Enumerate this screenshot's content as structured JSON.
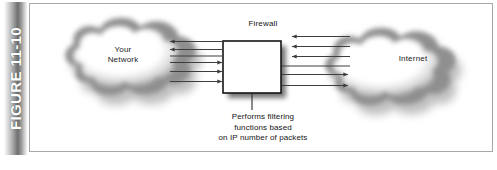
{
  "figure": {
    "tab_label": "FIGURE 11-10",
    "caption_alt": "Firewall between your network and the Internet"
  },
  "diagram": {
    "firewall_title": "Firewall",
    "firewall_caption": "Performs filtering\nfunctions based\non IP number of packets",
    "left_cloud_label": "Your\nNetwork",
    "right_cloud_label": "Internet",
    "arrows": {
      "left_group_inbound_count": 2,
      "left_group_outbound_count": 3,
      "right_group_inbound_count": 3,
      "right_group_outbound_count": 2
    }
  },
  "colors": {
    "tab_dark": "#6e6e6e",
    "tab_light": "#f2f2f2",
    "frame_border": "#a8a8a8",
    "line": "#4a4a4a",
    "box_stroke": "#1a1a1a",
    "cloud_edge": "#8c8c8c",
    "text": "#141414",
    "background": "#ffffff"
  }
}
